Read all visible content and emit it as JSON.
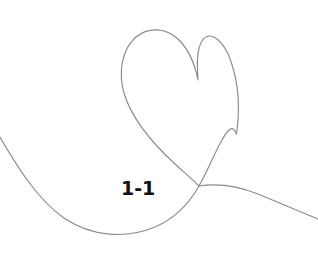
{
  "artwork": {
    "title": "1-1",
    "background_color": "#ffffff",
    "stroke_color": "#8a8a8f",
    "stroke_width": 1.15,
    "subject": "single-line heart with sweeping loop"
  },
  "label": {
    "text": "1-1",
    "color": "#111111",
    "x": 121,
    "y": 177,
    "font_size": 19,
    "weight": "bold"
  },
  "paths": {
    "heart_and_loop": "M 236.5 134 C 240 110 239 86 231.5 63 C 225 42 210 28 202 41 C 196.5 50 197 65 198 80 C 195 65 189 50 179 40 C 166 27 148 27 136 37 C 122 49 118 72 124 93 C 131 117 150 141 175 164 C 186 174 193 180 199 186",
    "heart_left_descender": "M 124 93 C 131 117 150 141 175 164",
    "loop_sweep": "M -2 134 C 18 168 38 200 64 218 C 92 237 126 239 155 227 C 176 218 190 202 199 186 C 208 170 215 152 222 140 C 228 129 233 124 236.5 134",
    "right_tail": "M 199 186 C 218 183 238 186 258 194 C 280 203 300 212 318 219"
  }
}
